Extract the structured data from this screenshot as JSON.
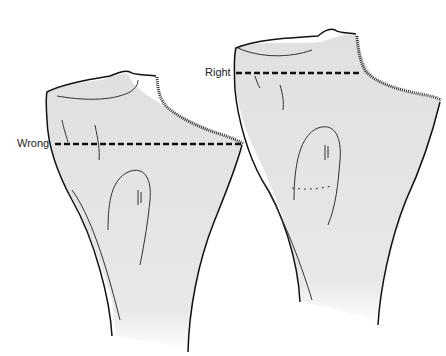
{
  "figure": {
    "labels": {
      "wrong": "Wrong",
      "right": "Right"
    },
    "colors": {
      "bone_fill": "#e4e4e4",
      "bone_outline": "#111111",
      "cut_line": "#111111",
      "background": "#ffffff"
    },
    "bones": [
      {
        "id": "left",
        "cut_label": "Wrong",
        "cut_position": "below articular surface, through metaphysis"
      },
      {
        "id": "right",
        "cut_label": "Right",
        "cut_position": "at level of articular margin"
      }
    ]
  }
}
